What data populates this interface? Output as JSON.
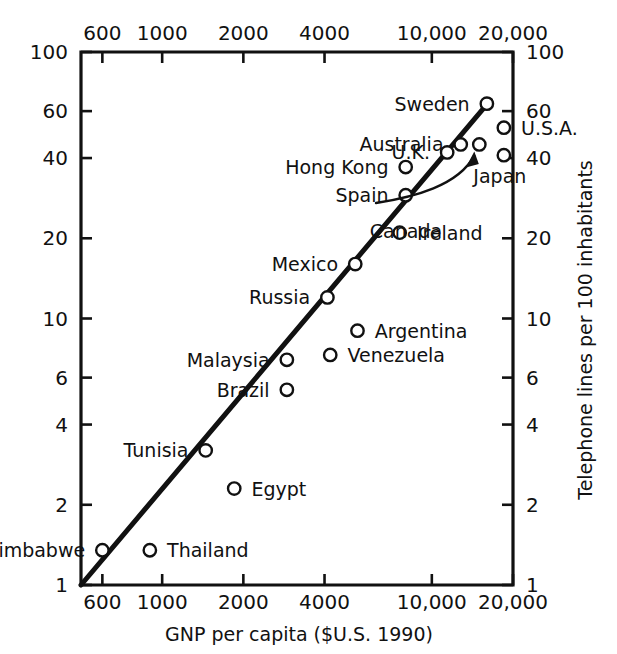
{
  "chart_data": {
    "type": "scatter",
    "title": "",
    "xlabel": "GNP per capita ($U.S. 1990)",
    "ylabel": "Telephone lines per 100 inhabitants",
    "xscale": "log",
    "yscale": "log",
    "xlim": [
      500,
      20000
    ],
    "ylim": [
      1,
      100
    ],
    "grid": false,
    "legend": "none",
    "x_ticks": [
      {
        "value": 600,
        "label": "600"
      },
      {
        "value": 1000,
        "label": "1000"
      },
      {
        "value": 2000,
        "label": "2000"
      },
      {
        "value": 4000,
        "label": "4000"
      },
      {
        "value": 10000,
        "label": "10,000"
      },
      {
        "value": 20000,
        "label": "20,000"
      }
    ],
    "y_ticks": [
      {
        "value": 1,
        "label": "1"
      },
      {
        "value": 2,
        "label": "2"
      },
      {
        "value": 4,
        "label": "4"
      },
      {
        "value": 6,
        "label": "6"
      },
      {
        "value": 10,
        "label": "10"
      },
      {
        "value": 20,
        "label": "20"
      },
      {
        "value": 40,
        "label": "40"
      },
      {
        "value": 60,
        "label": "60"
      },
      {
        "value": 100,
        "label": "100"
      }
    ],
    "top_axis_ticks_mirror": true,
    "right_axis_ticks_mirror": true,
    "points": [
      {
        "name": "Sweden",
        "x": 16000,
        "y": 64,
        "label_side": "left"
      },
      {
        "name": "U.S.A.",
        "x": 18500,
        "y": 52,
        "label_side": "right"
      },
      {
        "name": "Australia",
        "x": 12800,
        "y": 45,
        "label_side": "left"
      },
      {
        "name": "U.K.",
        "x": 11400,
        "y": 42,
        "label_side": "left"
      },
      {
        "name": "Japan",
        "x": 18500,
        "y": 41,
        "label_side": "below-right"
      },
      {
        "name": "Canada",
        "x": 15000,
        "y": 45,
        "label_side": "arrow-below"
      },
      {
        "name": "Hong Kong",
        "x": 8000,
        "y": 37,
        "label_side": "left"
      },
      {
        "name": "Spain",
        "x": 8000,
        "y": 29,
        "label_side": "left"
      },
      {
        "name": "Ireland",
        "x": 7600,
        "y": 21,
        "label_side": "right"
      },
      {
        "name": "Mexico",
        "x": 5200,
        "y": 16,
        "label_side": "left"
      },
      {
        "name": "Russia",
        "x": 4100,
        "y": 12,
        "label_side": "left"
      },
      {
        "name": "Argentina",
        "x": 5300,
        "y": 9.0,
        "label_side": "right"
      },
      {
        "name": "Venezuela",
        "x": 4200,
        "y": 7.3,
        "label_side": "right"
      },
      {
        "name": "Malaysia",
        "x": 2900,
        "y": 7.0,
        "label_side": "left"
      },
      {
        "name": "Brazil",
        "x": 2900,
        "y": 5.4,
        "label_side": "left"
      },
      {
        "name": "Tunisia",
        "x": 1450,
        "y": 3.2,
        "label_side": "left"
      },
      {
        "name": "Egypt",
        "x": 1850,
        "y": 2.3,
        "label_side": "right"
      },
      {
        "name": "Thailand",
        "x": 900,
        "y": 1.35,
        "label_side": "right"
      },
      {
        "name": "Zimbabwe",
        "x": 600,
        "y": 1.35,
        "label_side": "left"
      }
    ],
    "trend_line": {
      "description": "fitted straight line on log-log axes",
      "x_start": 500,
      "y_start": 1.0,
      "x_end": 16500,
      "y_end": 66
    },
    "annotations": [
      {
        "text": "Canada",
        "type": "arrow-callout",
        "target_point": "Canada"
      }
    ],
    "colors": {
      "ink": "#111111",
      "background": "#ffffff",
      "marker_fill": "#ffffff"
    }
  }
}
